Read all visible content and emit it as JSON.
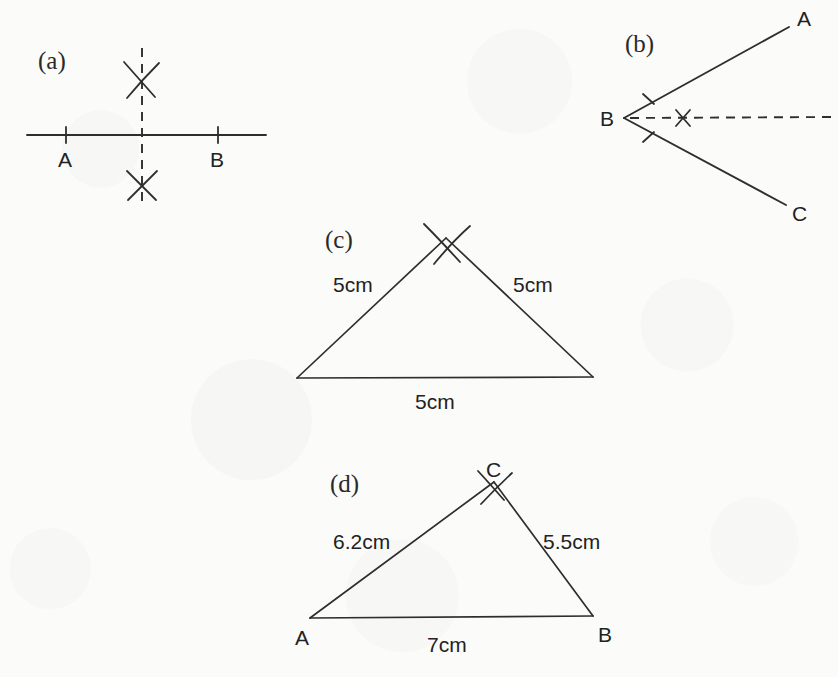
{
  "figure": {
    "background_color": "#fbfbf9",
    "ink_color": "#2e2e2e",
    "panels": [
      {
        "tag": "(a)",
        "title": "perpendicular bisector of line segment AB",
        "labels": {
          "a": "A",
          "b": "B"
        }
      },
      {
        "tag": "(b)",
        "title": "bisector of angle ABC",
        "labels": {
          "a": "A",
          "b": "B",
          "c": "C"
        }
      },
      {
        "tag": "(c)",
        "title": "equilateral triangle construction",
        "sides": {
          "left": "5cm",
          "right": "5cm",
          "base": "5cm"
        }
      },
      {
        "tag": "(d)",
        "title": "scalene triangle ABC construction",
        "labels": {
          "a": "A",
          "b": "B",
          "c": "C"
        },
        "sides": {
          "left": "6.2cm",
          "right": "5.5cm",
          "base": "7cm"
        }
      }
    ]
  }
}
